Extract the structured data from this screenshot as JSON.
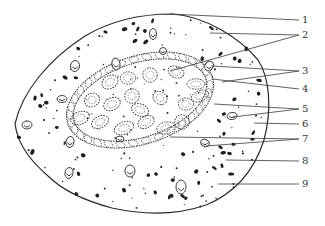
{
  "figure": {
    "type": "biological cross-section schematic",
    "line_color": "#2a2a2a",
    "background": "#ffffff",
    "labels": [
      {
        "id": "1",
        "text": "1"
      },
      {
        "id": "2",
        "text": "2"
      },
      {
        "id": "3",
        "text": "3"
      },
      {
        "id": "4",
        "text": "4"
      },
      {
        "id": "5",
        "text": "5"
      },
      {
        "id": "6",
        "text": "6"
      },
      {
        "id": "7",
        "text": "7"
      },
      {
        "id": "8",
        "text": "8"
      },
      {
        "id": "9",
        "text": "9"
      }
    ],
    "caption": "",
    "caption_note": "caption text clipped at bottom edge, illegible"
  }
}
